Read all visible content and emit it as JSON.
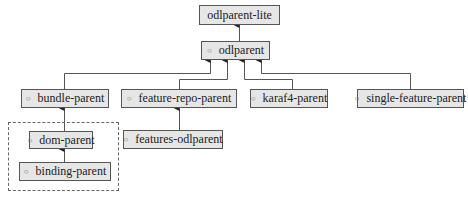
{
  "diagram": {
    "type": "inheritance-hierarchy",
    "nodes": {
      "odlparent_lite": {
        "label": "odlparent-lite",
        "bullet": ""
      },
      "odlparent": {
        "label": "odlparent",
        "bullet": "○"
      },
      "bundle_parent": {
        "label": "bundle-parent",
        "bullet": "○"
      },
      "feature_repo_parent": {
        "label": "feature-repo-parent",
        "bullet": "○"
      },
      "karaf4_parent": {
        "label": "karaf4-parent",
        "bullet": "○"
      },
      "single_feature_parent": {
        "label": "single-feature-parent",
        "bullet": "○"
      },
      "features_odlparent": {
        "label": "features-odlparent",
        "bullet": "○"
      },
      "dom_parent": {
        "label": "dom-parent",
        "bullet": "○"
      },
      "binding_parent": {
        "label": "binding-parent",
        "bullet": "○"
      }
    },
    "edges": [
      {
        "from": "odlparent",
        "to": "odlparent-lite"
      },
      {
        "from": "bundle-parent",
        "to": "odlparent"
      },
      {
        "from": "feature-repo-parent",
        "to": "odlparent"
      },
      {
        "from": "karaf4-parent",
        "to": "odlparent"
      },
      {
        "from": "single-feature-parent",
        "to": "odlparent"
      },
      {
        "from": "features-odlparent",
        "to": "feature-repo-parent"
      },
      {
        "from": "dom-parent",
        "to": "bundle-parent"
      },
      {
        "from": "binding-parent",
        "to": "dom-parent"
      }
    ],
    "groups": [
      {
        "name": "dashed-group",
        "members": [
          "dom-parent",
          "binding-parent"
        ]
      }
    ],
    "colors": {
      "node_fill": "#e6e6e6",
      "node_border": "#555555",
      "edge": "#444444"
    }
  }
}
